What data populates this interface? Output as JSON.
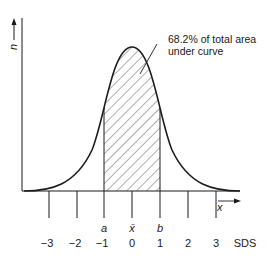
{
  "diagram": {
    "type": "normal-distribution",
    "y_axis_label": "n",
    "x_axis_label": "x",
    "annotation": {
      "line1": "68.2% of total area",
      "line2": "under curve"
    },
    "markers": {
      "a": "a",
      "mean": "x̄",
      "b": "b"
    },
    "ticks": [
      "−3",
      "−2",
      "−1",
      "0",
      "1",
      "2",
      "3"
    ],
    "unit_label": "SDS",
    "shaded_region": {
      "from": -1,
      "to": 1,
      "percent": "68.2%"
    },
    "colors": {
      "stroke": "#1a1a1a",
      "background": "#ffffff"
    }
  }
}
